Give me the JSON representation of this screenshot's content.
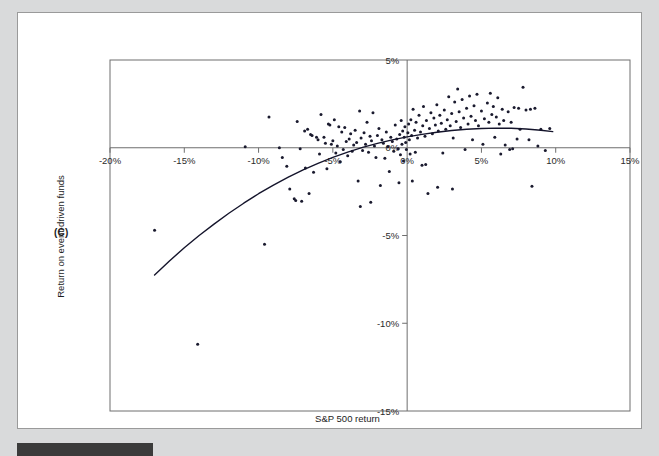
{
  "figure": {
    "panel_label": "(C)",
    "background_color": "#d9dadb",
    "card_color": "#ffffff",
    "frame_color": "#6e6e6e",
    "point_color": "#1a1a2e",
    "curve_color": "#14142b"
  },
  "chart_data": {
    "type": "scatter",
    "title": "",
    "xlabel": "S&P 500 return",
    "ylabel": "Return on event-driven funds",
    "xlim": [
      -20,
      15
    ],
    "ylim": [
      -15,
      5
    ],
    "grid": false,
    "legend": null,
    "xticks": [
      -20,
      -15,
      -10,
      -5,
      0,
      5,
      10,
      15
    ],
    "xticklabels": [
      "-20%",
      "-15%",
      "-10%",
      "-5%",
      "0%",
      "5%",
      "10%",
      "15%"
    ],
    "yticks": [
      5,
      0,
      -5,
      -10,
      -15
    ],
    "yticklabels": [
      "5%",
      "0%",
      "-5%",
      "-10%",
      "-15%"
    ],
    "axis_lines": {
      "x_zero": 0,
      "y_zero": 0
    },
    "points": [
      [
        -17.0,
        -4.7
      ],
      [
        -14.1,
        -11.2
      ],
      [
        -10.9,
        0.05
      ],
      [
        -9.6,
        -5.5
      ],
      [
        -9.3,
        1.75
      ],
      [
        -8.6,
        0.0
      ],
      [
        -8.4,
        -0.55
      ],
      [
        -7.9,
        -2.35
      ],
      [
        -7.6,
        -2.9
      ],
      [
        -7.5,
        -3.0
      ],
      [
        -7.4,
        1.5
      ],
      [
        -7.2,
        -0.05
      ],
      [
        -7.1,
        -3.05
      ],
      [
        -6.9,
        0.95
      ],
      [
        -6.7,
        1.05
      ],
      [
        -6.6,
        -2.6
      ],
      [
        -6.5,
        0.75
      ],
      [
        -6.4,
        0.7
      ],
      [
        -6.3,
        -1.4
      ],
      [
        -6.1,
        0.6
      ],
      [
        -6.0,
        0.45
      ],
      [
        -5.9,
        -0.35
      ],
      [
        -5.8,
        1.9
      ],
      [
        -5.6,
        0.6
      ],
      [
        -5.5,
        0.25
      ],
      [
        -5.4,
        -1.2
      ],
      [
        -5.3,
        1.35
      ],
      [
        -5.2,
        1.3
      ],
      [
        -5.1,
        0.2
      ],
      [
        -5.0,
        0.4
      ],
      [
        -4.9,
        1.6
      ],
      [
        -4.8,
        -0.3
      ],
      [
        -4.7,
        0.1
      ],
      [
        -4.6,
        1.2
      ],
      [
        -4.5,
        -0.8
      ],
      [
        -4.4,
        0.9
      ],
      [
        -4.3,
        -0.1
      ],
      [
        -4.2,
        1.15
      ],
      [
        -4.1,
        0.35
      ],
      [
        -4.0,
        -0.45
      ],
      [
        -3.9,
        0.5
      ],
      [
        -3.8,
        0.8
      ],
      [
        -3.7,
        -0.2
      ],
      [
        -3.6,
        0.15
      ],
      [
        -3.5,
        1.0
      ],
      [
        -3.4,
        0.3
      ],
      [
        -3.3,
        -1.9
      ],
      [
        -3.2,
        2.1
      ],
      [
        -3.1,
        0.55
      ],
      [
        -3.0,
        -0.15
      ],
      [
        -2.9,
        0.85
      ],
      [
        -2.8,
        0.2
      ],
      [
        -2.7,
        1.45
      ],
      [
        -2.6,
        -0.25
      ],
      [
        -2.5,
        0.65
      ],
      [
        -2.4,
        0.4
      ],
      [
        -2.3,
        2.0
      ],
      [
        -2.2,
        0.1
      ],
      [
        -2.1,
        -0.55
      ],
      [
        -2.0,
        0.7
      ],
      [
        -1.9,
        1.1
      ],
      [
        -1.8,
        -2.15
      ],
      [
        -1.7,
        0.45
      ],
      [
        -1.6,
        0.25
      ],
      [
        -1.5,
        -0.6
      ],
      [
        -1.4,
        0.9
      ],
      [
        -1.3,
        0.05
      ],
      [
        -1.2,
        -1.35
      ],
      [
        -1.1,
        0.6
      ],
      [
        -1.0,
        0.35
      ],
      [
        -0.9,
        -0.2
      ],
      [
        -0.8,
        1.3
      ],
      [
        -0.7,
        0.5
      ],
      [
        -0.6,
        -0.05
      ],
      [
        -0.5,
        0.75
      ],
      [
        -0.45,
        -0.4
      ],
      [
        -0.4,
        1.55
      ],
      [
        -0.35,
        0.2
      ],
      [
        -0.3,
        0.95
      ],
      [
        -0.25,
        -0.75
      ],
      [
        -0.2,
        0.6
      ],
      [
        -0.15,
        1.2
      ],
      [
        -0.1,
        0.3
      ],
      [
        -0.05,
        -0.1
      ],
      [
        0.05,
        0.85
      ],
      [
        0.1,
        1.35
      ],
      [
        0.15,
        0.45
      ],
      [
        0.2,
        -0.35
      ],
      [
        0.25,
        1.6
      ],
      [
        0.3,
        0.7
      ],
      [
        0.4,
        2.2
      ],
      [
        0.5,
        1.0
      ],
      [
        0.55,
        -0.25
      ],
      [
        0.6,
        1.45
      ],
      [
        0.7,
        0.55
      ],
      [
        0.8,
        1.85
      ],
      [
        0.9,
        0.9
      ],
      [
        1.0,
        -1.0
      ],
      [
        1.05,
        1.25
      ],
      [
        1.1,
        2.35
      ],
      [
        1.2,
        0.65
      ],
      [
        1.3,
        1.55
      ],
      [
        1.4,
        -2.6
      ],
      [
        1.5,
        1.1
      ],
      [
        1.6,
        2.0
      ],
      [
        1.7,
        0.8
      ],
      [
        1.8,
        1.7
      ],
      [
        1.9,
        1.3
      ],
      [
        2.0,
        2.45
      ],
      [
        2.1,
        0.95
      ],
      [
        2.2,
        1.85
      ],
      [
        2.3,
        1.4
      ],
      [
        2.4,
        -0.3
      ],
      [
        2.5,
        2.15
      ],
      [
        2.6,
        1.05
      ],
      [
        2.7,
        1.6
      ],
      [
        2.8,
        2.9
      ],
      [
        2.9,
        1.25
      ],
      [
        3.0,
        1.95
      ],
      [
        3.1,
        0.55
      ],
      [
        3.2,
        2.6
      ],
      [
        3.3,
        1.5
      ],
      [
        3.4,
        3.35
      ],
      [
        3.5,
        2.05
      ],
      [
        3.6,
        1.15
      ],
      [
        3.7,
        2.75
      ],
      [
        3.8,
        1.7
      ],
      [
        3.9,
        -0.1
      ],
      [
        4.0,
        2.25
      ],
      [
        4.1,
        1.35
      ],
      [
        4.2,
        2.95
      ],
      [
        4.3,
        1.8
      ],
      [
        4.4,
        0.45
      ],
      [
        4.5,
        2.4
      ],
      [
        4.6,
        1.55
      ],
      [
        4.7,
        3.05
      ],
      [
        4.8,
        1.25
      ],
      [
        5.0,
        2.1
      ],
      [
        5.1,
        0.2
      ],
      [
        5.2,
        1.65
      ],
      [
        5.4,
        2.55
      ],
      [
        5.5,
        1.45
      ],
      [
        5.6,
        3.1
      ],
      [
        5.7,
        1.9
      ],
      [
        5.8,
        2.35
      ],
      [
        5.9,
        0.6
      ],
      [
        6.0,
        1.75
      ],
      [
        6.1,
        2.85
      ],
      [
        6.2,
        1.35
      ],
      [
        6.3,
        -0.35
      ],
      [
        6.4,
        2.2
      ],
      [
        6.5,
        1.55
      ],
      [
        6.6,
        0.15
      ],
      [
        6.8,
        2.05
      ],
      [
        7.0,
        1.45
      ],
      [
        7.2,
        2.3
      ],
      [
        7.4,
        0.5
      ],
      [
        7.5,
        2.25
      ],
      [
        7.6,
        1.05
      ],
      [
        7.8,
        3.45
      ],
      [
        8.0,
        2.15
      ],
      [
        8.2,
        0.45
      ],
      [
        8.3,
        2.2
      ],
      [
        8.4,
        -2.2
      ],
      [
        8.6,
        2.25
      ],
      [
        8.8,
        0.1
      ],
      [
        9.0,
        1.05
      ],
      [
        9.3,
        -0.15
      ],
      [
        9.6,
        1.1
      ],
      [
        6.9,
        -0.1
      ],
      [
        7.1,
        -0.05
      ],
      [
        3.05,
        -2.35
      ],
      [
        2.05,
        -2.25
      ],
      [
        1.25,
        -0.95
      ],
      [
        0.35,
        -1.9
      ],
      [
        -0.55,
        -2.0
      ],
      [
        -2.45,
        -3.1
      ],
      [
        -3.15,
        -3.35
      ],
      [
        -6.85,
        -1.15
      ],
      [
        -8.1,
        -1.05
      ]
    ],
    "fit_curve": {
      "description": "quadratic fitted trend line",
      "x_range": [
        -17.0,
        9.8
      ],
      "points": [
        [
          -17.0,
          -7.25
        ],
        [
          -16.0,
          -6.45
        ],
        [
          -15.0,
          -5.7
        ],
        [
          -14.0,
          -5.0
        ],
        [
          -13.0,
          -4.35
        ],
        [
          -12.0,
          -3.73
        ],
        [
          -11.0,
          -3.16
        ],
        [
          -10.0,
          -2.62
        ],
        [
          -9.0,
          -2.13
        ],
        [
          -8.0,
          -1.68
        ],
        [
          -7.0,
          -1.26
        ],
        [
          -6.0,
          -0.89
        ],
        [
          -5.0,
          -0.55
        ],
        [
          -4.0,
          -0.25
        ],
        [
          -3.0,
          0.02
        ],
        [
          -2.0,
          0.25
        ],
        [
          -1.0,
          0.45
        ],
        [
          0.0,
          0.62
        ],
        [
          1.0,
          0.76
        ],
        [
          2.0,
          0.88
        ],
        [
          3.0,
          0.98
        ],
        [
          4.0,
          1.05
        ],
        [
          5.0,
          1.1
        ],
        [
          6.0,
          1.12
        ],
        [
          7.0,
          1.11
        ],
        [
          8.0,
          1.07
        ],
        [
          9.0,
          1.0
        ],
        [
          9.8,
          0.92
        ]
      ]
    }
  }
}
